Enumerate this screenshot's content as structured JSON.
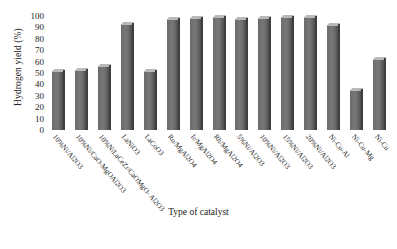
{
  "chart_data": {
    "type": "bar",
    "title": "",
    "xlabel": "Type of catalyst",
    "ylabel": "Hydrogen yield (%)",
    "ylim": [
      0,
      100
    ],
    "yticks": [
      100,
      90,
      80,
      70,
      60,
      50,
      40,
      30,
      20,
      10,
      0
    ],
    "grid": false,
    "legend": "none",
    "series_color": "#6f6f6f",
    "categories": [
      "10%Ni/Al2O3",
      "10%Ni/CaO-MgOAl2O3",
      "10%NiLaCeZr/CaOMgO- Al2O3",
      "LaNiO3",
      "LaCoO3",
      "Ru/MgAl2O4",
      "Ir/MgAl2O4",
      "Rh/MgAl2O4",
      "5%Ni/Al2O3",
      "10%Ni/Al2O3",
      "15%Ni/Al2O3",
      "20%Ni/Al2O3",
      "Ni-Cu-Al",
      "Ni-Cu-Mg",
      "Ni-Cu"
    ],
    "values": [
      52,
      53,
      56,
      93,
      52,
      97,
      98,
      99,
      97,
      98,
      99,
      99,
      92,
      35,
      62
    ]
  }
}
